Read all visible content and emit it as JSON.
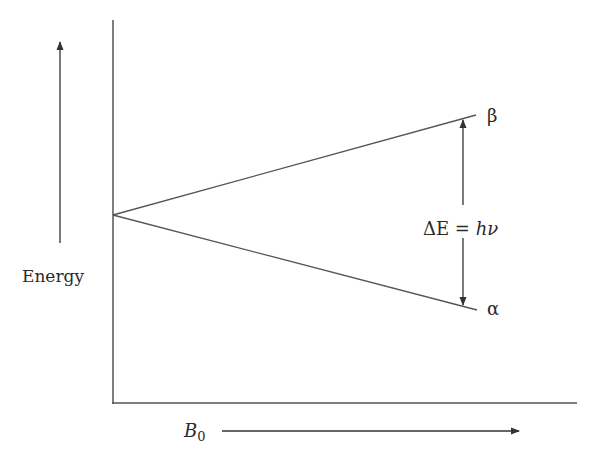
{
  "diagram": {
    "type": "energy-level-splitting",
    "y_axis_label": "Energy",
    "x_axis_label": "B",
    "x_axis_subscript": "0",
    "upper_level_label": "β",
    "lower_level_label": "α",
    "gap_label_prefix": "ΔE = ",
    "gap_label_h": "h",
    "gap_label_nu": "ν",
    "line_color": "#555555",
    "text_color": "#2a2a2a"
  }
}
